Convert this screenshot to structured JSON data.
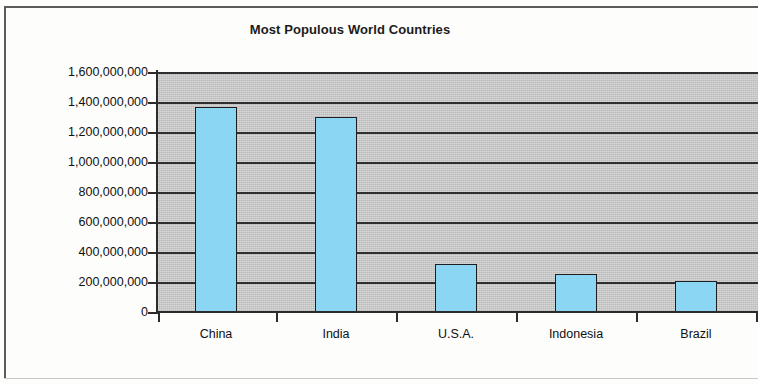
{
  "chart_data": {
    "type": "bar",
    "title": "Most Populous World Countries",
    "xlabel": "",
    "ylabel": "",
    "categories": [
      "China",
      "India",
      "U.S.A.",
      "Indonesia",
      "Brazil"
    ],
    "values": [
      1370000000,
      1300000000,
      320000000,
      255000000,
      205000000
    ],
    "ylim": [
      0,
      1600000000
    ],
    "ytick_step": 200000000,
    "ytick_labels": [
      "1,600,000,000",
      "1,400,000,000",
      "1,200,000,000",
      "1,000,000,000",
      "800,000,000",
      "600,000,000",
      "400,000,000",
      "200,000,000",
      "0"
    ],
    "ytick_values": [
      1600000000,
      1400000000,
      1200000000,
      1000000000,
      800000000,
      600000000,
      400000000,
      200000000,
      0
    ],
    "grid": true,
    "legend": false,
    "legend_position": "none",
    "bar_color": "#8bd6f3",
    "bar_border_color": "#1d1d1d",
    "plot_background": "#c9c9c9",
    "axis_color": "#2b2b2b",
    "gridline_color": "#2f2f2f",
    "title_color": "#1b1b1b",
    "tick_label_color": "#101010",
    "page_background": "#fdfdfc",
    "note": "Plot area is cropped at the right edge of the scan."
  }
}
